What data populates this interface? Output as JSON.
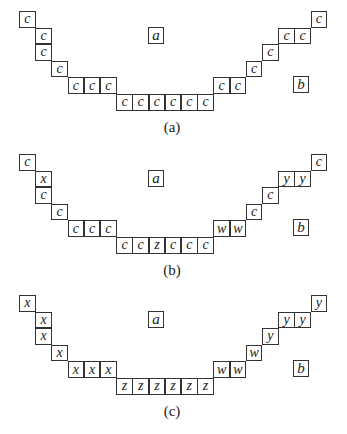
{
  "panels": [
    {
      "caption": "(a)",
      "marker_a": "a",
      "marker_b": "b",
      "cells": [
        {
          "col": 0,
          "row": 0,
          "label": "c"
        },
        {
          "col": 1,
          "row": 1,
          "label": "c"
        },
        {
          "col": 1,
          "row": 2,
          "label": "c"
        },
        {
          "col": 2,
          "row": 3,
          "label": "c"
        },
        {
          "col": 3,
          "row": 4,
          "label": "c"
        },
        {
          "col": 4,
          "row": 4,
          "label": "c"
        },
        {
          "col": 5,
          "row": 4,
          "label": "c"
        },
        {
          "col": 6,
          "row": 5,
          "label": "c"
        },
        {
          "col": 7,
          "row": 5,
          "label": "c"
        },
        {
          "col": 8,
          "row": 5,
          "label": "c"
        },
        {
          "col": 9,
          "row": 5,
          "label": "c"
        },
        {
          "col": 10,
          "row": 5,
          "label": "c"
        },
        {
          "col": 11,
          "row": 5,
          "label": "c"
        },
        {
          "col": 12,
          "row": 4,
          "label": "c"
        },
        {
          "col": 13,
          "row": 4,
          "label": "c"
        },
        {
          "col": 14,
          "row": 3,
          "label": "c"
        },
        {
          "col": 15,
          "row": 2,
          "label": "c"
        },
        {
          "col": 16,
          "row": 1,
          "label": "c"
        },
        {
          "col": 17,
          "row": 1,
          "label": "c"
        },
        {
          "col": 18,
          "row": 0,
          "label": "c"
        }
      ]
    },
    {
      "caption": "(b)",
      "marker_a": "a",
      "marker_b": "b",
      "cells": [
        {
          "col": 0,
          "row": 0,
          "label": "c"
        },
        {
          "col": 1,
          "row": 1,
          "label": "x"
        },
        {
          "col": 1,
          "row": 2,
          "label": "c"
        },
        {
          "col": 2,
          "row": 3,
          "label": "c"
        },
        {
          "col": 3,
          "row": 4,
          "label": "c"
        },
        {
          "col": 4,
          "row": 4,
          "label": "c"
        },
        {
          "col": 5,
          "row": 4,
          "label": "c"
        },
        {
          "col": 6,
          "row": 5,
          "label": "c"
        },
        {
          "col": 7,
          "row": 5,
          "label": "c"
        },
        {
          "col": 8,
          "row": 5,
          "label": "z"
        },
        {
          "col": 9,
          "row": 5,
          "label": "c"
        },
        {
          "col": 10,
          "row": 5,
          "label": "c"
        },
        {
          "col": 11,
          "row": 5,
          "label": "c"
        },
        {
          "col": 12,
          "row": 4,
          "label": "w"
        },
        {
          "col": 13,
          "row": 4,
          "label": "w"
        },
        {
          "col": 14,
          "row": 3,
          "label": "c"
        },
        {
          "col": 15,
          "row": 2,
          "label": "c"
        },
        {
          "col": 16,
          "row": 1,
          "label": "y"
        },
        {
          "col": 17,
          "row": 1,
          "label": "y"
        },
        {
          "col": 18,
          "row": 0,
          "label": "c"
        }
      ]
    },
    {
      "caption": "(c)",
      "marker_a": "a",
      "marker_b": "b",
      "cells": [
        {
          "col": 0,
          "row": 0,
          "label": "x"
        },
        {
          "col": 1,
          "row": 1,
          "label": "x"
        },
        {
          "col": 1,
          "row": 2,
          "label": "x"
        },
        {
          "col": 2,
          "row": 3,
          "label": "x"
        },
        {
          "col": 3,
          "row": 4,
          "label": "x"
        },
        {
          "col": 4,
          "row": 4,
          "label": "x"
        },
        {
          "col": 5,
          "row": 4,
          "label": "x"
        },
        {
          "col": 6,
          "row": 5,
          "label": "z"
        },
        {
          "col": 7,
          "row": 5,
          "label": "z"
        },
        {
          "col": 8,
          "row": 5,
          "label": "z"
        },
        {
          "col": 9,
          "row": 5,
          "label": "z"
        },
        {
          "col": 10,
          "row": 5,
          "label": "z"
        },
        {
          "col": 11,
          "row": 5,
          "label": "z"
        },
        {
          "col": 12,
          "row": 4,
          "label": "w"
        },
        {
          "col": 13,
          "row": 4,
          "label": "w"
        },
        {
          "col": 14,
          "row": 3,
          "label": "w"
        },
        {
          "col": 15,
          "row": 2,
          "label": "y"
        },
        {
          "col": 16,
          "row": 1,
          "label": "y"
        },
        {
          "col": 17,
          "row": 1,
          "label": "y"
        },
        {
          "col": 18,
          "row": 0,
          "label": "y"
        }
      ]
    }
  ]
}
